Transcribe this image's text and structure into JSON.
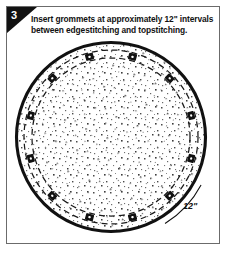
{
  "panel": {
    "step_number": "3",
    "border_color": "#6b6b6b",
    "background_color": "#ffffff",
    "ink_color": "#111111"
  },
  "instruction": {
    "line1": "Insert grommets at approximately 12\" intervals",
    "line2": "between edgestitching and topstitching."
  },
  "diagram": {
    "fill_label": "stippled fabric texture",
    "outer_edge_label": "finished edge",
    "outer_stitch_label": "edgestitching",
    "inner_stitch_label": "topstitching",
    "grommet_count": 12,
    "dimension_label": "12\"",
    "center": {
      "x": 104,
      "y": 100
    },
    "outer_radius": 95,
    "outer_stroke_width": 3.1,
    "edgestitch_radius": 87,
    "topstitch_radius": 79,
    "grommet_radius": 83,
    "grommet_outer_size": 4.1,
    "grommet_hole_size": 1.3,
    "dash_pattern": "6 4",
    "grommet_angles_deg": [
      -75,
      -45,
      -15,
      15,
      45,
      75,
      105,
      135,
      165,
      195,
      225,
      255
    ],
    "callout": {
      "text": "12\"",
      "x": 176,
      "y": 170,
      "arc_start_deg": 28,
      "arc_end_deg": 58
    }
  },
  "colors": {
    "stroke": "#111111",
    "dash_stroke": "#1a1a1a",
    "paper": "#ffffff",
    "stipple": "#5a5a5a",
    "wedge": "#121212",
    "wedge_text": "#ffffff"
  }
}
